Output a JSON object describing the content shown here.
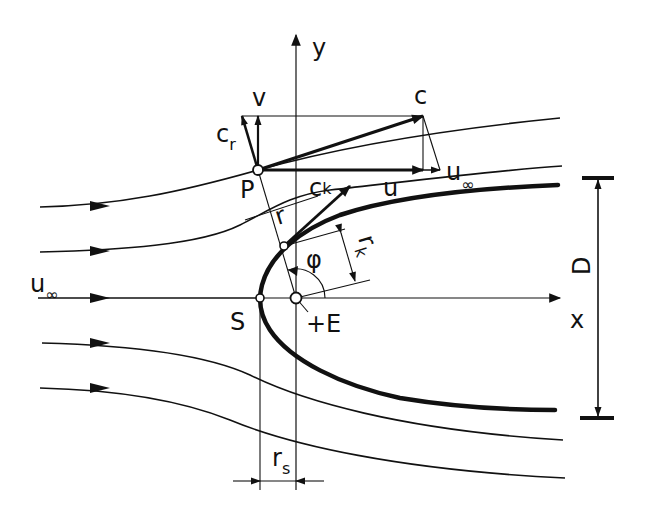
{
  "figure": {
    "colors": {
      "ink": "#111111",
      "background": "#ffffff"
    }
  },
  "axes": {
    "x_label": "x",
    "y_label": "y"
  },
  "points": {
    "P": "P",
    "S": "S",
    "E": "+E"
  },
  "vectors": {
    "c": "c",
    "v": "v",
    "u": "u",
    "c_r_main": "c",
    "c_r_sub": "r",
    "c_k_main": "c",
    "c_k_sub": "k",
    "u_inf_main": "u",
    "u_inf_sub": "∞"
  },
  "freestream": {
    "main": "u",
    "sub": "∞"
  },
  "dimensions": {
    "r": "r",
    "r_k_main": "r",
    "r_k_sub": "k",
    "phi": "φ",
    "D": "D",
    "r_s_main": "r",
    "r_s_sub": "s"
  }
}
